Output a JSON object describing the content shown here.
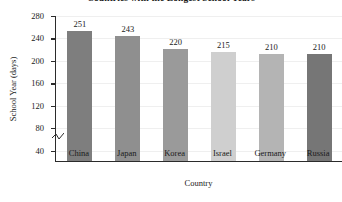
{
  "chart_data": {
    "type": "bar",
    "title": "Countries with the Longest School Years",
    "xlabel": "Country",
    "ylabel": "School Year (days)",
    "categories": [
      "China",
      "Japan",
      "Korea",
      "Israel",
      "Germany",
      "Russia"
    ],
    "values": [
      251,
      243,
      220,
      215,
      210,
      210
    ],
    "bar_colors": [
      "#7e7e7e",
      "#8f8f8f",
      "#9a9a9a",
      "#cfcfcf",
      "#b4b4b4",
      "#767676"
    ],
    "ylim": [
      20,
      280
    ],
    "yticks": [
      40,
      80,
      120,
      160,
      200,
      240,
      280
    ],
    "ytick_labels": [
      "40",
      "80",
      "120",
      "160",
      "200",
      "240",
      "280"
    ],
    "axis_break": true,
    "grid": true,
    "legend": null,
    "value_labels": [
      "251",
      "243",
      "220",
      "215",
      "210",
      "210"
    ]
  },
  "axis": {
    "line_color": "#2b2b2b",
    "grid_color": "#efefef"
  }
}
